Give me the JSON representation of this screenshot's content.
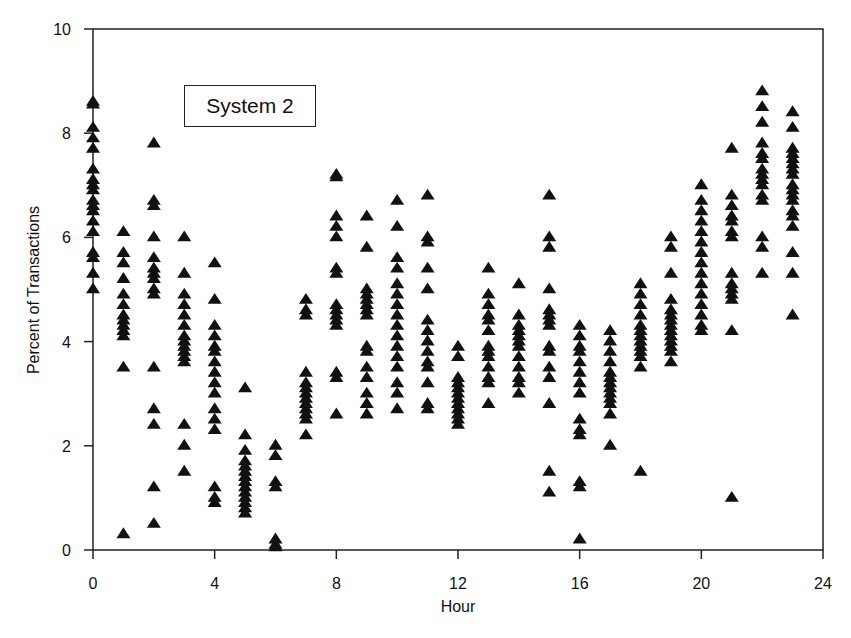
{
  "chart_data": {
    "type": "scatter",
    "title": "",
    "legend": [
      "System 2"
    ],
    "xlabel": "Hour",
    "ylabel": "Percent of Transactions",
    "xlim": [
      0,
      24
    ],
    "ylim": [
      0,
      10
    ],
    "xticks": [
      0,
      4,
      8,
      12,
      16,
      20,
      24
    ],
    "yticks": [
      0,
      2,
      4,
      6,
      8,
      10
    ],
    "grid": false,
    "marker": "filled-triangle",
    "marker_color": "#111111",
    "series": [
      {
        "name": "System 2",
        "points_by_hour": {
          "0": [
            8.6,
            8.55,
            8.1,
            7.9,
            7.7,
            7.3,
            7.1,
            7.0,
            6.9,
            6.7,
            6.6,
            6.5,
            6.3,
            6.1,
            5.7,
            5.6,
            5.3,
            5.0
          ],
          "1": [
            6.1,
            5.7,
            5.5,
            5.2,
            4.9,
            4.7,
            4.5,
            4.4,
            4.3,
            4.2,
            4.1,
            3.5,
            0.3
          ],
          "2": [
            7.8,
            6.7,
            6.6,
            6.0,
            5.6,
            5.4,
            5.3,
            5.2,
            5.0,
            4.9,
            3.5,
            2.7,
            2.4,
            1.2,
            0.5
          ],
          "3": [
            6.0,
            5.3,
            4.9,
            4.7,
            4.5,
            4.3,
            4.1,
            4.0,
            3.9,
            3.8,
            3.7,
            3.6,
            2.4,
            2.0,
            1.5
          ],
          "4": [
            5.5,
            4.8,
            4.3,
            4.1,
            3.9,
            3.8,
            3.6,
            3.4,
            3.2,
            3.0,
            2.7,
            2.5,
            2.3,
            1.2,
            1.0,
            0.9
          ],
          "5": [
            3.1,
            2.2,
            1.9,
            1.7,
            1.6,
            1.5,
            1.4,
            1.3,
            1.2,
            1.1,
            1.0,
            0.9,
            0.8,
            0.7
          ],
          "6": [
            2.0,
            1.8,
            1.3,
            1.2,
            0.2,
            0.1,
            0.05
          ],
          "7": [
            4.8,
            4.6,
            4.5,
            3.4,
            3.2,
            3.1,
            3.0,
            2.9,
            2.8,
            2.7,
            2.6,
            2.5,
            2.2
          ],
          "8": [
            7.2,
            7.15,
            6.4,
            6.2,
            6.0,
            5.4,
            5.3,
            4.7,
            4.6,
            4.5,
            4.4,
            4.3,
            3.4,
            3.3,
            2.6
          ],
          "9": [
            6.4,
            5.8,
            5.0,
            4.9,
            4.8,
            4.7,
            4.6,
            4.5,
            3.9,
            3.8,
            3.5,
            3.3,
            3.0,
            2.8,
            2.6
          ],
          "10": [
            6.7,
            6.2,
            5.6,
            5.4,
            5.1,
            4.9,
            4.7,
            4.5,
            4.3,
            4.1,
            3.9,
            3.7,
            3.5,
            3.2,
            3.0,
            2.7
          ],
          "11": [
            6.8,
            6.0,
            5.9,
            5.4,
            5.0,
            4.4,
            4.2,
            4.0,
            3.8,
            3.6,
            3.5,
            3.2,
            2.8,
            2.7
          ],
          "12": [
            3.9,
            3.7,
            3.3,
            3.2,
            3.1,
            3.0,
            2.9,
            2.8,
            2.7,
            2.6,
            2.5,
            2.4
          ],
          "13": [
            5.4,
            4.9,
            4.7,
            4.5,
            4.4,
            4.2,
            3.9,
            3.8,
            3.7,
            3.5,
            3.3,
            3.2,
            2.8
          ],
          "14": [
            5.1,
            4.5,
            4.3,
            4.2,
            4.1,
            4.0,
            3.9,
            3.7,
            3.5,
            3.3,
            3.2,
            3.0
          ],
          "15": [
            6.8,
            6.0,
            5.8,
            5.0,
            4.6,
            4.5,
            4.4,
            4.3,
            3.9,
            3.8,
            3.5,
            3.3,
            2.8,
            1.5,
            1.1
          ],
          "16": [
            4.3,
            4.1,
            3.9,
            3.8,
            3.6,
            3.4,
            3.2,
            3.0,
            2.5,
            2.3,
            2.2,
            1.3,
            1.2,
            0.2
          ],
          "17": [
            4.2,
            4.0,
            3.8,
            3.6,
            3.4,
            3.3,
            3.2,
            3.1,
            3.0,
            2.9,
            2.8,
            2.6,
            2.0
          ],
          "18": [
            5.1,
            4.9,
            4.7,
            4.5,
            4.3,
            4.2,
            4.1,
            4.0,
            3.9,
            3.8,
            3.7,
            3.5,
            1.5
          ],
          "19": [
            6.0,
            5.8,
            5.3,
            4.8,
            4.6,
            4.5,
            4.4,
            4.3,
            4.2,
            4.1,
            4.0,
            3.9,
            3.8,
            3.6
          ],
          "20": [
            7.0,
            6.7,
            6.5,
            6.3,
            6.1,
            5.9,
            5.7,
            5.5,
            5.3,
            5.1,
            4.9,
            4.7,
            4.5,
            4.3,
            4.2
          ],
          "21": [
            7.7,
            6.8,
            6.6,
            6.4,
            6.3,
            6.1,
            6.0,
            5.3,
            5.1,
            5.0,
            4.9,
            4.8,
            4.2,
            1.0
          ],
          "22": [
            8.8,
            8.5,
            8.2,
            7.8,
            7.6,
            7.5,
            7.3,
            7.2,
            7.1,
            7.0,
            6.8,
            6.7,
            6.0,
            5.8,
            5.3
          ],
          "23": [
            8.4,
            8.1,
            7.7,
            7.6,
            7.5,
            7.4,
            7.3,
            7.2,
            7.0,
            6.9,
            6.8,
            6.7,
            6.5,
            6.4,
            6.2,
            5.7,
            5.3,
            4.5
          ]
        }
      }
    ]
  },
  "legend_box": {
    "label": "System 2"
  },
  "axes": {
    "x_title": "Hour",
    "y_title": "Percent of Transactions",
    "x_tick_labels": [
      "0",
      "4",
      "8",
      "12",
      "16",
      "20",
      "24"
    ],
    "y_tick_labels": [
      "0",
      "2",
      "4",
      "6",
      "8",
      "10"
    ]
  }
}
